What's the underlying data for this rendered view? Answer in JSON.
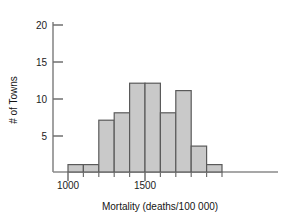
{
  "chart_data": {
    "type": "bar",
    "title": "",
    "subtitle": "",
    "xlabel": "Mortality (deaths/100 000)",
    "ylabel": "# of Towns",
    "grid": false,
    "legend": null,
    "bin_width": 100,
    "bin_starts": [
      1000,
      1100,
      1200,
      1300,
      1400,
      1500,
      1600,
      1700,
      1800,
      1900
    ],
    "bin_ends": [
      1100,
      1200,
      1300,
      1400,
      1500,
      1600,
      1700,
      1800,
      1900,
      2000
    ],
    "categories": [
      "1000-1100",
      "1100-1200",
      "1200-1300",
      "1300-1400",
      "1400-1500",
      "1500-1600",
      "1600-1700",
      "1700-1800",
      "1800-1900",
      "1900-2000"
    ],
    "values": [
      1,
      1,
      7,
      8,
      12,
      12,
      8,
      11,
      3.5,
      1
    ],
    "xlim": [
      950,
      2060
    ],
    "ylim": [
      0,
      21.5
    ],
    "x_ticks": [
      1000,
      1100,
      1200,
      1300,
      1400,
      1500,
      1600,
      1700,
      1800,
      1900,
      2000
    ],
    "x_tick_labels": [
      "1000",
      "",
      "",
      "",
      "",
      "1500",
      "",
      "",
      "",
      "",
      ""
    ],
    "x_major_labels": [
      "1000",
      "1500"
    ],
    "y_ticks": [
      5,
      10,
      15,
      20
    ],
    "y_tick_labels": [
      "5",
      "10",
      "15",
      "20"
    ],
    "bar_fill": "#c9c9c9",
    "bar_stroke": "#5a5a5a",
    "axis_color": "#8a8a8a"
  },
  "axes": {
    "y_label": "# of Towns",
    "x_label": "Mortality (deaths/100 000)",
    "y_tick_20": "20",
    "y_tick_15": "15",
    "y_tick_10": "10",
    "y_tick_5": "5",
    "x_tick_1000": "1000",
    "x_tick_1500": "1500"
  }
}
